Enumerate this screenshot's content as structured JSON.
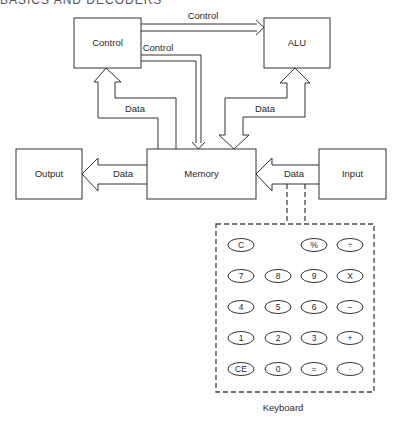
{
  "header": {
    "cropped_title": "BASICS AND DECODERS"
  },
  "diagram": {
    "blocks": {
      "control": {
        "label": "Control"
      },
      "alu": {
        "label": "ALU"
      },
      "memory": {
        "label": "Memory"
      },
      "output": {
        "label": "Output"
      },
      "input": {
        "label": "Input"
      }
    },
    "arrows": {
      "control_to_alu": {
        "label": "Control"
      },
      "control_to_memory": {
        "label": "Control"
      },
      "memory_control_data": {
        "label": "Data"
      },
      "memory_alu_data": {
        "label": "Data"
      },
      "memory_to_output": {
        "label": "Data"
      },
      "input_to_memory": {
        "label": "Data"
      }
    },
    "keyboard": {
      "label": "Keyboard",
      "rows": [
        [
          "C",
          "",
          "%",
          "÷"
        ],
        [
          "7",
          "8",
          "9",
          "X"
        ],
        [
          "4",
          "5",
          "6",
          "−"
        ],
        [
          "1",
          "2",
          "3",
          "+"
        ],
        [
          "CE",
          "0",
          "=",
          "·"
        ]
      ]
    }
  }
}
